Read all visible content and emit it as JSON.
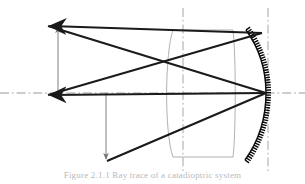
{
  "figure": {
    "caption": "Figure 2.1.1  Ray trace of a catadioptric system",
    "background_color": "#ffffff",
    "ray_color": "#1a1a1a",
    "element_outline_color": "#a8a8a8",
    "axis_color": "#9a9a9a",
    "hatch_color": "#000000",
    "caption_color": "#b9b9b9"
  },
  "axes": {
    "optical_axis": {
      "name": "optical-axis",
      "style": "dash-dot",
      "y": 93,
      "x_start": 0,
      "x_end": 305
    },
    "lens_center_axis": {
      "name": "lens-center-axis",
      "style": "dash-dot",
      "x": 183,
      "y_start": 8,
      "y_end": 172
    },
    "mirror_center_axis": {
      "name": "mirror-center-axis",
      "style": "dash-dot",
      "x": 268,
      "y_start": 8,
      "y_end": 172
    }
  },
  "elements": {
    "corrector_lens": {
      "name": "corrector-lens",
      "type": "meniscus-lens",
      "outline_color": "#a8a8a8",
      "top_y": 30,
      "bottom_y": 157,
      "left_vertex_x": 172,
      "right_edge_x": 233,
      "curve_bulge": "left-concave"
    },
    "primary_mirror": {
      "name": "primary-mirror",
      "type": "concave-spherical-mirror",
      "vertex_x": 266,
      "vertex_y": 93,
      "top_y": 30,
      "bottom_y": 160,
      "hatching": "back-surface-ticks",
      "hatch_count": 56
    }
  },
  "rays": [
    {
      "name": "ray-upper-incoming",
      "from": [
        262,
        33
      ],
      "to": [
        44,
        26
      ],
      "arrowhead": "end",
      "weight": "thick"
    },
    {
      "name": "ray-lower-incoming",
      "from": [
        266,
        93
      ],
      "to": [
        44,
        95
      ],
      "arrowhead": "end",
      "weight": "thick"
    },
    {
      "name": "ray-upper-reflected",
      "from": [
        44,
        26
      ],
      "to": [
        266,
        93
      ],
      "weight": "thick"
    },
    {
      "name": "ray-lower-reflected",
      "from": [
        44,
        95
      ],
      "to": [
        262,
        33
      ],
      "weight": "thick"
    },
    {
      "name": "ray-bottom-diverging",
      "from": [
        107,
        160
      ],
      "to": [
        266,
        93
      ],
      "weight": "thick"
    }
  ],
  "dimension_markers": [
    {
      "name": "image-height-marker-upper",
      "orientation": "vertical",
      "x": 58,
      "from_y": 93,
      "to_y": 25,
      "arrowhead": "top",
      "weight": "thin"
    },
    {
      "name": "image-height-marker-lower",
      "orientation": "vertical",
      "x": 106,
      "from_y": 93,
      "to_y": 161,
      "arrowhead": "bottom",
      "weight": "thin"
    }
  ]
}
